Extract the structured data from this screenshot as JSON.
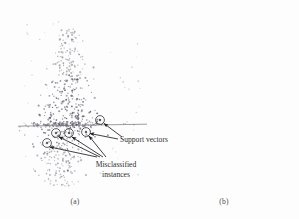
{
  "figure": {
    "type": "two-panel-scatter",
    "background_color": "#fdfdfd"
  },
  "panels": [
    {
      "id": "a",
      "caption": "(a)",
      "description": "Scatter of projected instances with SVM decision boundary; support vectors and misclassified instances circled"
    },
    {
      "id": "b",
      "caption": "(b)",
      "description": "Scatter of projected instances with SVM decision boundary; dense smudged cluster below the boundary"
    }
  ],
  "annotations": {
    "support_vectors_label": "Support vectors",
    "misclassified_label_line1": "Misclassified",
    "misclassified_label_line2": "instances"
  },
  "colors": {
    "point": "#7a7a86",
    "point_dark": "#4c4c58",
    "boundary_line": "#6f6f78",
    "circle_marker": "#3a3a42",
    "arrow": "#1f1f24",
    "text": "#2e2e2e",
    "caption": "#4a4a4a",
    "smudge": "#9a9aa2"
  },
  "chart_data": {
    "type": "scatter",
    "title": "",
    "xlabel": "",
    "ylabel": "",
    "grid": false,
    "legend": null,
    "panels": [
      {
        "name": "(a)",
        "decision_boundary": {
          "orientation": "horizontal",
          "y": 125,
          "x_start": 18,
          "x_end": 147
        },
        "point_count_above": 300,
        "point_count_below": 210,
        "support_vectors_circled": [
          {
            "x": 100,
            "y": 120
          },
          {
            "x": 86,
            "y": 132
          },
          {
            "x": 69,
            "y": 133
          },
          {
            "x": 56,
            "y": 133
          },
          {
            "x": 47,
            "y": 143
          }
        ]
      },
      {
        "name": "(b)",
        "decision_boundary": {
          "orientation": "horizontal",
          "y": 125,
          "x_start": 155,
          "x_end": 292
        },
        "point_count_above": 300,
        "point_count_below": 260,
        "support_vectors_circled": []
      }
    ]
  }
}
